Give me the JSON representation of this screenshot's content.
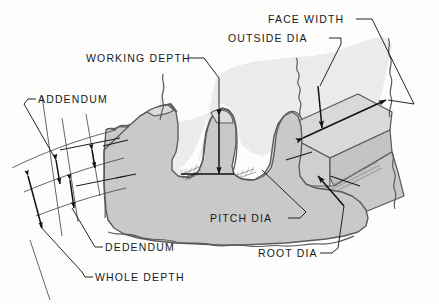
{
  "figure": {
    "background_color": "#fdfdfc"
  },
  "colors": {
    "body_fill": "#c9c9c9",
    "face_fill": "#ebebeb",
    "top_land_fill": "#e3e3e3",
    "flank_fill": "#d6d6d6",
    "outline": "#5a5a5a",
    "line": "#1a1a1a",
    "hatch": "#6e6e6e",
    "text": "#1a1a1a"
  },
  "labels": {
    "face_width": "FACE WIDTH",
    "outside_dia": "OUTSIDE DIA",
    "working_depth": "WORKING DEPTH",
    "addendum": "ADDENDUM",
    "dedendum": "DEDENDUM",
    "whole_depth": "WHOLE DEPTH",
    "pitch_dia": "PITCH DIA",
    "root_dia": "ROOT DIA"
  },
  "dimensions": {
    "addendum_note": "distance from pitch line to outside diameter",
    "dedendum_note": "distance from pitch line to root diameter",
    "whole_depth_note": "addendum plus dedendum",
    "working_depth_note": "depth of tooth engagement measured on tooth flank"
  }
}
